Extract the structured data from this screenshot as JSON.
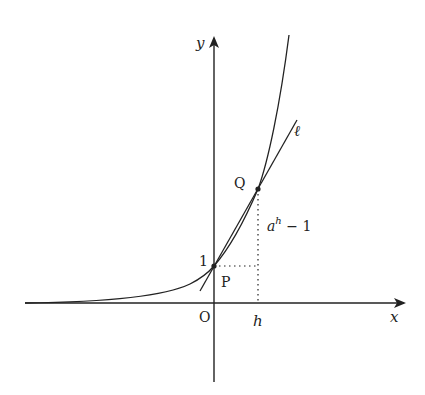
{
  "figure": {
    "axes": {
      "x_label": "x",
      "y_label": "y",
      "origin_label": "O"
    },
    "points": {
      "P": {
        "label": "P",
        "value_label": "1"
      },
      "Q": {
        "label": "Q"
      }
    },
    "line_label": "ℓ",
    "h_label": "h",
    "increment_label_base": "a",
    "increment_label_exp": "h",
    "increment_label_tail": " − 1",
    "curve": "y = a^x",
    "colors": {
      "ink": "#222222",
      "background": "#ffffff"
    }
  }
}
